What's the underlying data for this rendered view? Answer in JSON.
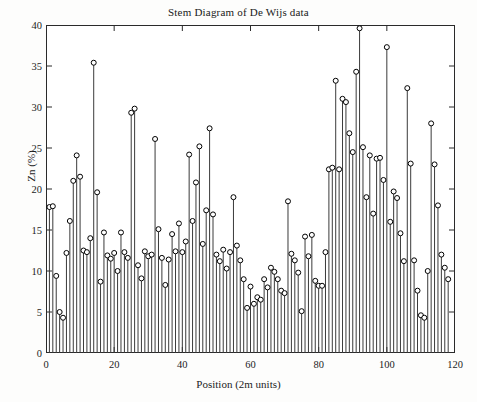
{
  "chart_data": {
    "type": "line",
    "style": "stem",
    "title": "Stem Diagram of De Wijs data",
    "xlabel": "Position (2m units)",
    "ylabel": "Zn (%)",
    "xlim": [
      0,
      120
    ],
    "ylim": [
      0,
      40
    ],
    "xticks": [
      0,
      20,
      40,
      60,
      80,
      100,
      120
    ],
    "yticks": [
      0,
      5,
      10,
      15,
      20,
      25,
      30,
      35,
      40
    ],
    "grid": false,
    "legend": false,
    "marker": "open-circle",
    "marker_color": "#000000",
    "stem_color": "#3a3a3a",
    "baseline": 0,
    "n_points": 118,
    "series": [
      {
        "name": "Zn (%)",
        "x": [
          1,
          2,
          3,
          4,
          5,
          6,
          7,
          8,
          9,
          10,
          11,
          12,
          13,
          14,
          15,
          16,
          17,
          18,
          19,
          20,
          21,
          22,
          23,
          24,
          25,
          26,
          27,
          28,
          29,
          30,
          31,
          32,
          33,
          34,
          35,
          36,
          37,
          38,
          39,
          40,
          41,
          42,
          43,
          44,
          45,
          46,
          47,
          48,
          49,
          50,
          51,
          52,
          53,
          54,
          55,
          56,
          57,
          58,
          59,
          60,
          61,
          62,
          63,
          64,
          65,
          66,
          67,
          68,
          69,
          70,
          71,
          72,
          73,
          74,
          75,
          76,
          77,
          78,
          79,
          80,
          81,
          82,
          83,
          84,
          85,
          86,
          87,
          88,
          89,
          90,
          91,
          92,
          93,
          94,
          95,
          96,
          97,
          98,
          99,
          100,
          101,
          102,
          103,
          104,
          105,
          106,
          107,
          108,
          109,
          110,
          111,
          112,
          113,
          114,
          115,
          116,
          117,
          118
        ],
        "values": [
          17.8,
          17.9,
          9.4,
          5.0,
          4.3,
          12.2,
          16.1,
          21.0,
          24.1,
          21.5,
          12.5,
          12.3,
          14.0,
          35.4,
          19.6,
          8.7,
          14.7,
          11.9,
          11.5,
          12.2,
          10.0,
          14.7,
          12.3,
          11.6,
          29.3,
          29.8,
          10.7,
          9.1,
          12.4,
          11.8,
          12.0,
          26.1,
          15.1,
          11.6,
          8.3,
          11.4,
          14.5,
          12.4,
          15.8,
          12.3,
          13.6,
          24.2,
          16.1,
          20.8,
          25.2,
          13.3,
          17.4,
          27.4,
          16.9,
          12.0,
          11.2,
          12.6,
          10.3,
          12.3,
          19.0,
          13.1,
          11.3,
          9.0,
          5.5,
          8.1,
          6.0,
          6.8,
          6.5,
          9.0,
          8.0,
          10.4,
          9.9,
          9.0,
          7.6,
          7.3,
          18.5,
          12.1,
          11.3,
          9.8,
          5.1,
          14.2,
          11.8,
          14.4,
          8.8,
          8.2,
          8.2,
          12.3,
          22.4,
          22.6,
          33.2,
          22.4,
          31.0,
          30.6,
          26.8,
          24.5,
          34.3,
          39.6,
          25.1,
          19.0,
          24.1,
          17.0,
          23.7,
          23.8,
          21.1,
          37.3,
          16.0,
          19.7,
          18.9,
          14.6,
          11.2,
          32.3,
          23.1,
          11.3,
          7.6,
          4.6,
          4.3,
          10.0,
          28.0,
          23.0,
          18.0,
          12.0,
          10.4,
          9.0
        ]
      }
    ],
    "notes": {
      "max_value": 39.6,
      "max_position": 92,
      "min_value": 4.3,
      "valley_range": "58-75"
    }
  },
  "axes": {
    "y_tick_labels": [
      "40",
      "35",
      "30",
      "25",
      "20",
      "15",
      "10",
      "5",
      "0"
    ],
    "x_tick_labels": [
      "0",
      "20",
      "40",
      "60",
      "80",
      "100",
      "120"
    ],
    "y_axis_title": "Zn (%)",
    "x_axis_title": "Position (2m units)"
  },
  "figure": {
    "title": "Stem Diagram of De Wijs data"
  }
}
